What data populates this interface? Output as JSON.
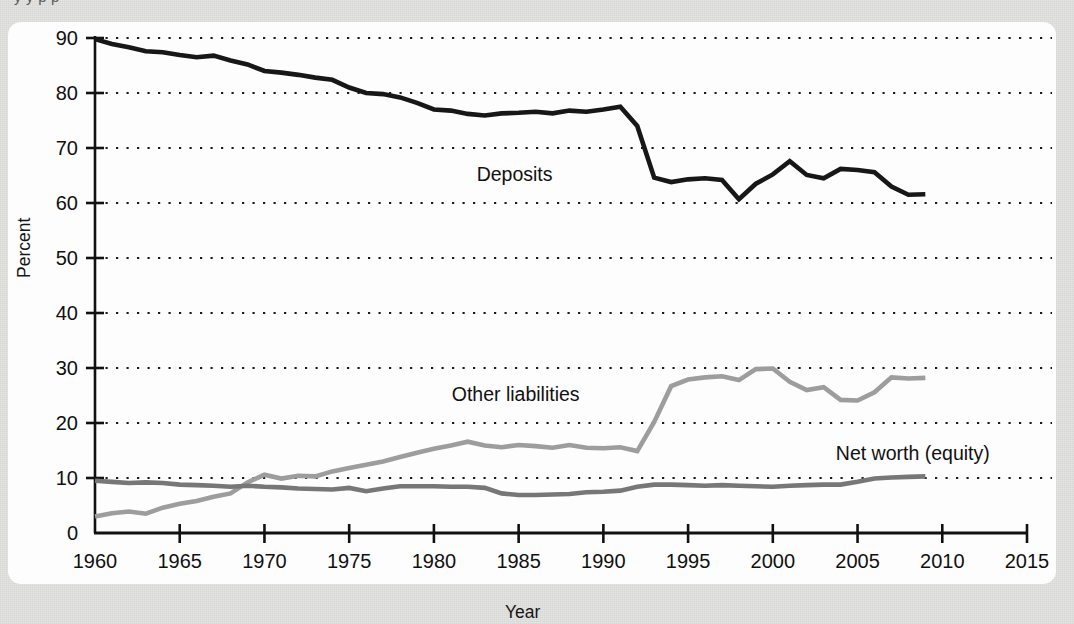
{
  "figure": {
    "truncated_caption_above": "y                            y                                      p        p",
    "panel_background": "#fdfdfd",
    "page_background": "#e3e3e1"
  },
  "chart_data": {
    "type": "line",
    "title": "",
    "subtitle": "",
    "xlabel": "Year",
    "ylabel": "Percent",
    "xlim": [
      1960,
      2015
    ],
    "ylim": [
      0,
      90
    ],
    "xticks": [
      1960,
      1965,
      1970,
      1975,
      1980,
      1985,
      1990,
      1995,
      2000,
      2005,
      2010,
      2015
    ],
    "yticks": [
      0,
      10,
      20,
      30,
      40,
      50,
      60,
      70,
      80,
      90
    ],
    "xtick_labels": [
      "1960",
      "1965",
      "1970",
      "1975",
      "1980",
      "1985",
      "1990",
      "1995",
      "2000",
      "2005",
      "2010",
      "2015"
    ],
    "ytick_labels": [
      "0",
      "10",
      "20",
      "30",
      "40",
      "50",
      "60",
      "70",
      "80",
      "90"
    ],
    "grid": "horizontal-dotted",
    "legend_position": "inline-annotations",
    "annotations": [
      {
        "text": "Deposits",
        "x": 1987.0,
        "y": 64.0,
        "anchor": "end",
        "color": "#111111"
      },
      {
        "text": "Other liabilities",
        "x": 1988.6,
        "y": 24.0,
        "anchor": "end",
        "color": "#111111"
      },
      {
        "text": "Net worth (equity)",
        "x": 2012.8,
        "y": 13.2,
        "anchor": "end",
        "color": "#111111"
      }
    ],
    "x": [
      1960,
      1961,
      1962,
      1963,
      1964,
      1965,
      1966,
      1967,
      1968,
      1969,
      1970,
      1971,
      1972,
      1973,
      1974,
      1975,
      1976,
      1977,
      1978,
      1979,
      1980,
      1981,
      1982,
      1983,
      1984,
      1985,
      1986,
      1987,
      1988,
      1989,
      1990,
      1991,
      1992,
      1993,
      1994,
      1995,
      1996,
      1997,
      1998,
      1999,
      2000,
      2001,
      2002,
      2003,
      2004,
      2005,
      2006,
      2007,
      2008,
      2009
    ],
    "series": [
      {
        "name": "Deposits",
        "color": "#171717",
        "width": 4.6,
        "values": [
          89.8,
          88.9,
          88.3,
          87.6,
          87.4,
          86.9,
          86.5,
          86.8,
          85.9,
          85.2,
          84.0,
          83.7,
          83.3,
          82.8,
          82.4,
          81.0,
          80.0,
          79.8,
          79.2,
          78.2,
          77.0,
          76.8,
          76.2,
          75.9,
          76.3,
          76.4,
          76.6,
          76.3,
          76.8,
          76.6,
          77.0,
          77.5,
          74.0,
          64.6,
          63.8,
          64.3,
          64.5,
          64.2,
          60.7,
          63.5,
          65.2,
          67.6,
          65.1,
          64.5,
          66.2,
          66.0,
          65.6,
          63.0,
          61.5,
          61.6
        ]
      },
      {
        "name": "Other liabilities",
        "color": "#9d9d9d",
        "width": 4.6,
        "values": [
          3.0,
          3.6,
          3.9,
          3.5,
          4.6,
          5.3,
          5.8,
          6.6,
          7.2,
          9.2,
          10.6,
          9.9,
          10.4,
          10.3,
          11.2,
          11.8,
          12.4,
          13.0,
          13.8,
          14.6,
          15.3,
          15.9,
          16.6,
          15.9,
          15.6,
          16.0,
          15.8,
          15.5,
          16.0,
          15.5,
          15.4,
          15.6,
          14.9,
          20.2,
          26.7,
          27.9,
          28.3,
          28.5,
          27.8,
          29.8,
          29.9,
          27.5,
          26.0,
          26.5,
          24.2,
          24.1,
          25.6,
          28.3,
          28.1,
          28.2
        ]
      },
      {
        "name": "Net worth (equity)",
        "color": "#777777",
        "width": 4.6,
        "values": [
          9.5,
          9.3,
          9.1,
          9.2,
          9.1,
          8.8,
          8.7,
          8.6,
          8.4,
          8.6,
          8.4,
          8.3,
          8.1,
          8.0,
          7.9,
          8.2,
          7.6,
          8.1,
          8.5,
          8.5,
          8.5,
          8.4,
          8.4,
          8.2,
          7.2,
          6.9,
          6.9,
          7.0,
          7.1,
          7.4,
          7.5,
          7.7,
          8.4,
          8.8,
          8.8,
          8.7,
          8.6,
          8.7,
          8.6,
          8.5,
          8.4,
          8.6,
          8.7,
          8.8,
          8.8,
          9.3,
          9.9,
          10.1,
          10.2,
          10.3
        ]
      }
    ]
  }
}
